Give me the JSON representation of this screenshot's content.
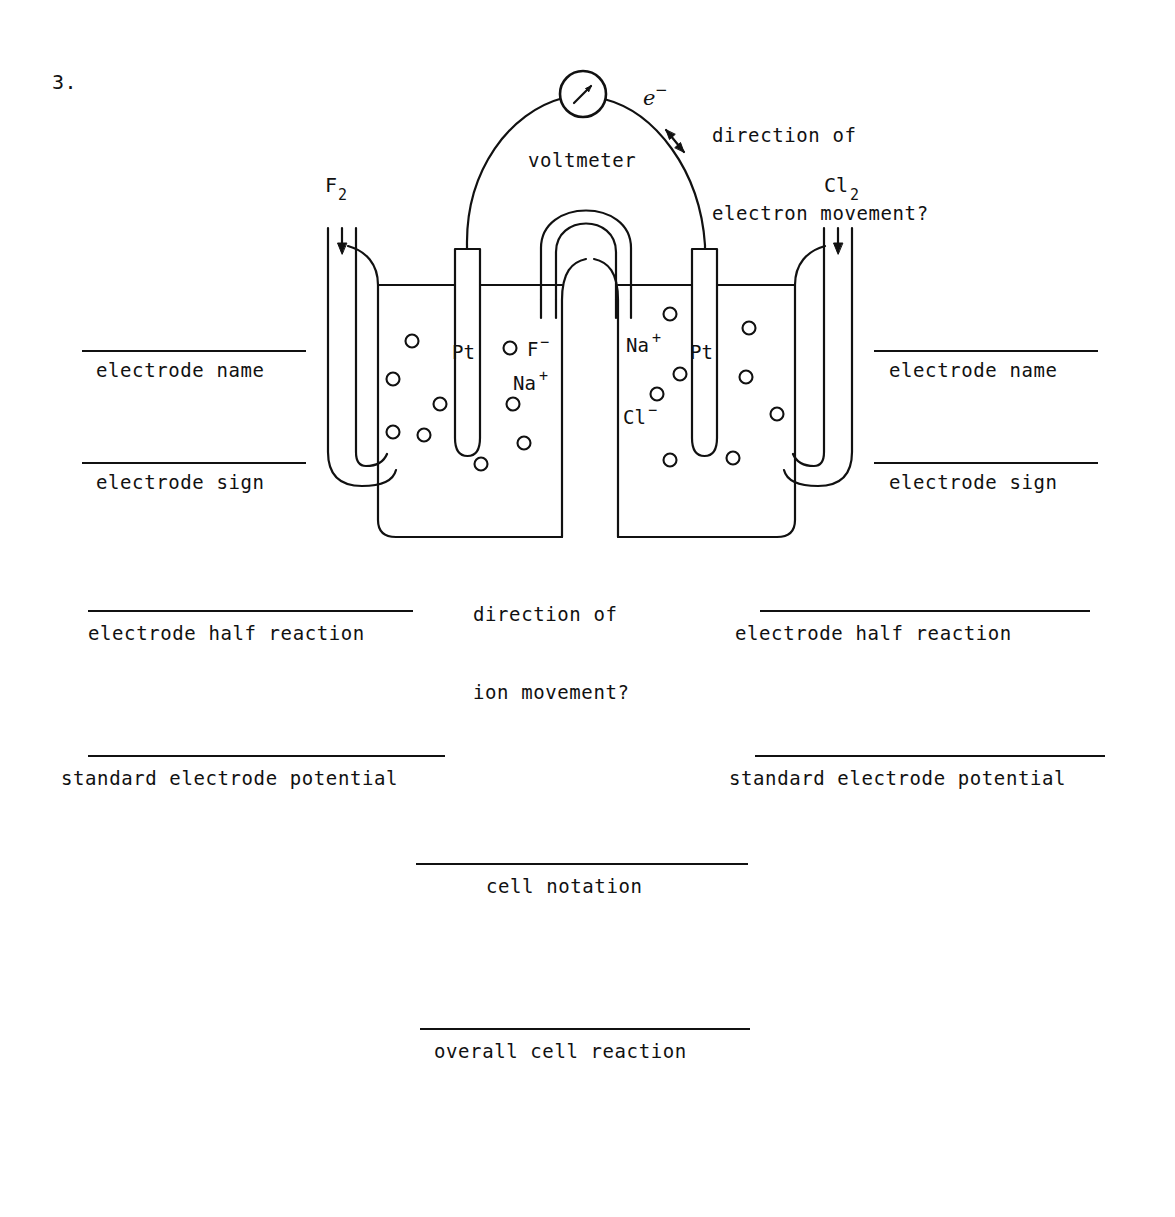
{
  "page": {
    "question_number": "3.",
    "background_color": "#ffffff",
    "ink_color": "#111111"
  },
  "diagram": {
    "title_hint": "electrochemical cell with two gas electrodes and salt bridge",
    "voltmeter_label": "voltmeter",
    "electron_symbol": "e⁻",
    "electron_question": "direction of\nelectron movement?",
    "electron_question_line1": "direction of",
    "electron_question_line2": "electron movement?",
    "ion_question_line1": "direction of",
    "ion_question_line2": "ion movement?",
    "left_gas": {
      "formula": "F",
      "subscript": "2",
      "display": "F₂"
    },
    "right_gas": {
      "formula": "Cl",
      "subscript": "2",
      "display": "Cl₂"
    },
    "left_electrode_metal": "Pt",
    "right_electrode_metal": "Pt",
    "left_solution_ions": [
      {
        "symbol": "F",
        "charge": "−",
        "display": "F⁻"
      },
      {
        "symbol": "Na",
        "charge": "+",
        "display": "Na⁺"
      }
    ],
    "right_solution_ions": [
      {
        "symbol": "Na",
        "charge": "+",
        "display": "Na⁺"
      },
      {
        "symbol": "Cl",
        "charge": "−",
        "display": "Cl⁻"
      }
    ],
    "left_ion_dot_count": 11,
    "right_ion_dot_count": 11
  },
  "blanks": {
    "left": [
      {
        "id": "left-electrode-name",
        "label": "electrode name"
      },
      {
        "id": "left-electrode-sign",
        "label": "electrode sign"
      },
      {
        "id": "left-electrode-half-reaction",
        "label": "electrode half reaction"
      },
      {
        "id": "left-standard-electrode-potential",
        "label": "standard electrode potential"
      }
    ],
    "right": [
      {
        "id": "right-electrode-name",
        "label": "electrode name"
      },
      {
        "id": "right-electrode-sign",
        "label": "electrode sign"
      },
      {
        "id": "right-electrode-half-reaction",
        "label": "electrode half reaction"
      },
      {
        "id": "right-standard-electrode-potential",
        "label": "standard electrode potential"
      }
    ],
    "center": [
      {
        "id": "cell-notation",
        "label": "cell notation"
      },
      {
        "id": "overall-cell-reaction",
        "label": "overall cell reaction"
      }
    ]
  }
}
